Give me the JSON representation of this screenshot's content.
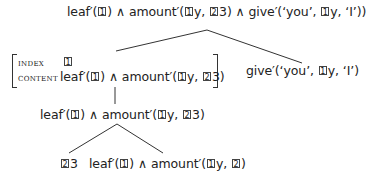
{
  "tree": {
    "root": {
      "parts": [
        "leaf′(",
        "1",
        ") ∧ amount′(",
        "1",
        "y, ",
        "2",
        "3) ∧ give′(‘you’, ",
        "1",
        "y, ‘I’))"
      ]
    },
    "avm": {
      "index_label": "index",
      "index_value": "1",
      "content_label": "content",
      "content_parts": [
        "leaf′(",
        "1",
        ") ∧ amount′(",
        "1",
        "y, ",
        "2",
        "3)"
      ]
    },
    "give_node": {
      "parts": [
        "give′(‘you’, ",
        "1",
        "y, ‘I’)"
      ]
    },
    "mid_node": {
      "parts": [
        "leaf′(",
        "1",
        ") ∧ amount′(",
        "1",
        "y, ",
        "2",
        "3)"
      ]
    },
    "leaf_left": {
      "parts": [
        "2",
        "3"
      ]
    },
    "leaf_right": {
      "parts": [
        "leaf′(",
        "1",
        ") ∧ amount′(",
        "1",
        "y, ",
        "2",
        ")"
      ]
    }
  },
  "colors": {
    "line": "#333333",
    "text": "#222222"
  }
}
